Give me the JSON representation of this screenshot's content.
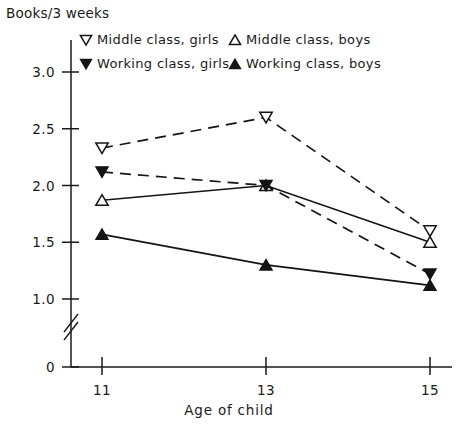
{
  "chart_data": {
    "type": "line",
    "title": "",
    "ylabel": "Books/3 weeks",
    "xlabel": "Age of child",
    "x": [
      11,
      13,
      15
    ],
    "xtick_labels": [
      "11",
      "13",
      "15"
    ],
    "ytick_labels": [
      "3.0",
      "2.5",
      "2.0",
      "1.5",
      "1.0",
      "0"
    ],
    "ytick_values": [
      3.0,
      2.5,
      2.0,
      1.5,
      1.0,
      0
    ],
    "ylim": [
      1.0,
      3.0
    ],
    "xlim": [
      11,
      15
    ],
    "axis_broken": true,
    "grid": false,
    "legend_position": "top-inside",
    "series": [
      {
        "name": "Middle class, girls",
        "marker": "triangle-down-open",
        "line_style": "dashed",
        "values": [
          2.33,
          2.6,
          1.6
        ]
      },
      {
        "name": "Middle class, boys",
        "marker": "triangle-up-open",
        "line_style": "solid",
        "values": [
          1.87,
          2.0,
          1.5
        ]
      },
      {
        "name": "Working class, girls",
        "marker": "triangle-down-filled",
        "line_style": "dashed",
        "values": [
          2.12,
          2.0,
          1.22
        ]
      },
      {
        "name": "Working class, boys",
        "marker": "triangle-up-filled",
        "line_style": "solid",
        "values": [
          1.57,
          1.3,
          1.12
        ]
      }
    ]
  },
  "legend": {
    "entries": [
      {
        "label": "Middle class, girls",
        "marker": "triangle-down-open"
      },
      {
        "label": "Middle class, boys",
        "marker": "triangle-up-open"
      },
      {
        "label": "Working class, girls",
        "marker": "triangle-down-filled"
      },
      {
        "label": "Working class, boys",
        "marker": "triangle-up-filled"
      }
    ]
  },
  "colors": {
    "ink": "#141414",
    "background": "#ffffff"
  }
}
